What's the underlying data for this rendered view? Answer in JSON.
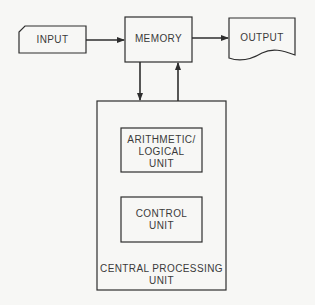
{
  "diagram": {
    "type": "block-diagram",
    "nodes": {
      "input": {
        "label": "INPUT",
        "shape": "card"
      },
      "memory": {
        "label": "MEMORY",
        "shape": "rectangle"
      },
      "output": {
        "label": "OUTPUT",
        "shape": "document"
      },
      "cpu": {
        "label_line1": "CENTRAL PROCESSING",
        "label_line2": "UNIT",
        "shape": "rectangle"
      },
      "alu": {
        "label_line1": "ARITHMETIC/",
        "label_line2": "LOGICAL",
        "label_line3": "UNIT",
        "shape": "rectangle"
      },
      "control": {
        "label_line1": "CONTROL",
        "label_line2": "UNIT",
        "shape": "rectangle"
      }
    },
    "edges": [
      {
        "from": "input",
        "to": "memory"
      },
      {
        "from": "memory",
        "to": "output"
      },
      {
        "from": "memory",
        "to": "cpu"
      },
      {
        "from": "cpu",
        "to": "memory"
      }
    ],
    "colors": {
      "line": "#2e2e2e",
      "fill": "#f7f7f5",
      "text": "#3a3a3a"
    }
  }
}
